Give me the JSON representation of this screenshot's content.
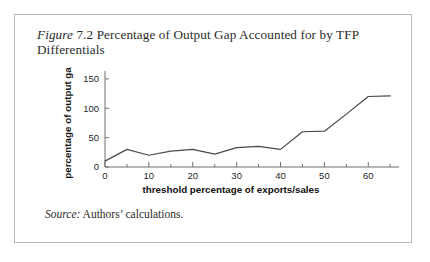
{
  "figure": {
    "label_italic": "Figure",
    "number": "7.2",
    "title_rest": "Percentage of Output Gap Accounted for by TFP Differentials",
    "full_title": "Figure 7.2 Percentage of Output Gap Accounted for by TFP Differentials"
  },
  "source": {
    "label": "Source:",
    "text": "Authors’ calculations."
  },
  "chart_data": {
    "type": "line",
    "title": "",
    "xlabel": "threshold percentage of exports/sales",
    "ylabel": "percentage of output gap",
    "xlim": [
      0,
      67
    ],
    "ylim": [
      0,
      160
    ],
    "xticks": [
      0,
      10,
      20,
      30,
      40,
      50,
      60
    ],
    "xtick_labels": [
      "0",
      "10",
      "20",
      "30",
      "40",
      "50",
      "60"
    ],
    "xminor_step": 5,
    "yticks": [
      0,
      50,
      100,
      150
    ],
    "ytick_labels": [
      "0",
      "50",
      "100",
      "150"
    ],
    "grid": false,
    "legend": "none",
    "line_color": "#4a4a4a",
    "series": [
      {
        "name": "percentage of output gap",
        "x": [
          0,
          5,
          10,
          15,
          20,
          25,
          30,
          35,
          40,
          45,
          50,
          55,
          60,
          65
        ],
        "values": [
          10,
          30,
          20,
          27,
          30,
          22,
          33,
          35,
          30,
          60,
          61,
          90,
          120,
          121
        ]
      }
    ]
  }
}
